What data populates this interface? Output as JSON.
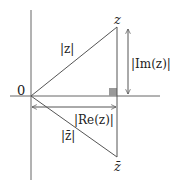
{
  "diagram": {
    "labels": {
      "origin": "0",
      "z": "z",
      "z_bar": "z̄",
      "abs_z": "|z|",
      "abs_z_bar": "|z̄|",
      "abs_im": "|Im(z)|",
      "abs_re": "|Re(z)|"
    },
    "points": {
      "origin": [
        31,
        96
      ],
      "z": [
        117,
        27
      ],
      "z_bar": [
        117,
        157
      ]
    },
    "colors": {
      "line": "#555555",
      "right_angle_marker": "#999999"
    }
  }
}
